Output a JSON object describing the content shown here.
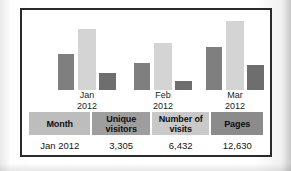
{
  "panel": {
    "border_color": "#2a2a2a",
    "background": "#ffffff"
  },
  "chart_data": {
    "type": "bar",
    "title": "",
    "subtitle": "",
    "xlabel": "",
    "ylabel": "",
    "grid": false,
    "legend": "none",
    "categories": [
      "Jan 2012",
      "Feb 2012",
      "Mar 2012"
    ],
    "category_lines": [
      {
        "month": "Jan",
        "year": "2012"
      },
      {
        "month": "Feb",
        "year": "2012"
      },
      {
        "month": "Mar",
        "year": "2012"
      }
    ],
    "series": [
      {
        "name": "Unique visitors",
        "color": "#7f7f7f",
        "values": [
          3305,
          2600,
          4300
        ]
      },
      {
        "name": "Number of visits",
        "color": "#d4d4d4",
        "values": [
          6432,
          4700,
          7400
        ]
      },
      {
        "name": "Pages",
        "color": "#6e6e6e",
        "values": [
          1200,
          700,
          2200
        ]
      }
    ],
    "ylim": [
      0,
      8000
    ],
    "bar_pixel_heights": [
      [
        36,
        61,
        17
      ],
      [
        27,
        47,
        9
      ],
      [
        43,
        69,
        25
      ]
    ]
  },
  "table": {
    "headers": [
      {
        "label": "Month",
        "color": "#bdbdbd"
      },
      {
        "label": "Unique visitors",
        "line1": "Unique",
        "line2": "visitors",
        "color": "#9e9e9e"
      },
      {
        "label": "Number of visits",
        "line1": "Number of",
        "line2": "visits",
        "color": "#c9c9c9"
      },
      {
        "label": "Pages",
        "color": "#8b8b8b"
      }
    ],
    "rows": [
      {
        "month": "Jan 2012",
        "unique_visitors": "3,305",
        "number_of_visits": "6,432",
        "pages": "12,630"
      }
    ]
  }
}
